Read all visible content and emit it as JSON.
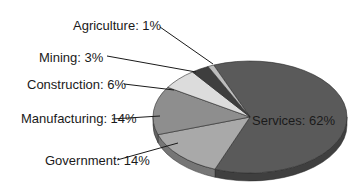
{
  "chart_data": {
    "type": "pie",
    "style": "3d",
    "title": "",
    "categories": [
      "Services",
      "Government",
      "Manufacturing",
      "Construction",
      "Mining",
      "Agriculture"
    ],
    "values": [
      62,
      14,
      14,
      6,
      3,
      1
    ],
    "unit": "%",
    "labels": [
      "Services: 62%",
      "Government: 14%",
      "Manufacturing: 14%",
      "Construction: 6%",
      "Mining: 3%",
      "Agriculture: 1%"
    ],
    "colors": [
      "#5a5a5a",
      "#a9a9a9",
      "#8e8e8e",
      "#dcdcdc",
      "#3e3e3e",
      "#bdbdbd"
    ],
    "legend": "none (labels with leader lines)"
  }
}
